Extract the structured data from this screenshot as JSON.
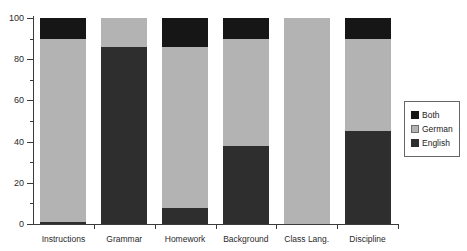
{
  "chart_data": {
    "type": "bar",
    "stacked": true,
    "title": "",
    "xlabel": "",
    "ylabel": "",
    "ylim": [
      0,
      100
    ],
    "yticks": [
      0,
      20,
      40,
      60,
      80,
      100
    ],
    "yticks_minor": [
      10,
      30,
      50,
      70,
      90
    ],
    "grid": false,
    "legend_position": "right",
    "categories": [
      "Instructions",
      "Grammar",
      "Homework",
      "Background",
      "Class Lang.",
      "Discipline"
    ],
    "series": [
      {
        "name": "English",
        "color": "#2e2e2e",
        "values": [
          1,
          86,
          8,
          38,
          0,
          45
        ]
      },
      {
        "name": "German",
        "color": "#b3b3b3",
        "values": [
          89,
          14,
          78,
          52,
          100,
          45
        ]
      },
      {
        "name": "Both",
        "color": "#161616",
        "values": [
          10,
          0,
          14,
          10,
          0,
          10
        ]
      }
    ],
    "legend": [
      {
        "label": "Both",
        "color": "#161616",
        "border": "#161616"
      },
      {
        "label": "German",
        "color": "#b3b3b3",
        "border": "#6e6e6e"
      },
      {
        "label": "English",
        "color": "#2e2e2e",
        "border": "#2e2e2e"
      }
    ]
  }
}
